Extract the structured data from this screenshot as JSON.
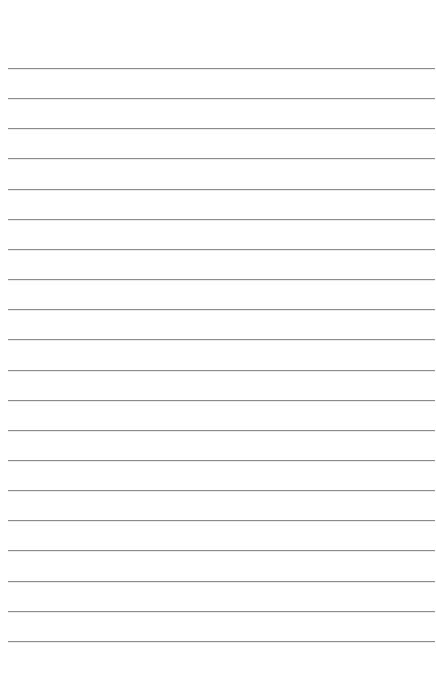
{
  "page": {
    "type": "lined-paper",
    "background_color": "#ffffff",
    "line_color": "#8c8c8c",
    "line_count": 20,
    "first_line_y": 68,
    "line_spacing": 30.15,
    "line_left": 8,
    "line_right": 435
  }
}
